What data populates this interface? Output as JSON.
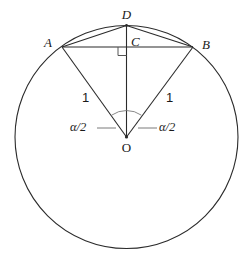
{
  "figure": {
    "background_color": "#ffffff",
    "stroke_color": "#2b2b2b",
    "width": 251,
    "height": 261
  },
  "labels": {
    "point_a": "A",
    "point_b": "B",
    "point_c": "C",
    "point_d": "D",
    "point_o": "O",
    "radius_left": "1",
    "radius_right": "1",
    "angle_left": "α/2",
    "angle_right": "α/2"
  },
  "geometry": {
    "circle": {
      "cx": 126.5,
      "cy": 137,
      "r": 111.5
    },
    "points": {
      "A": {
        "x": 62,
        "y": 47
      },
      "B": {
        "x": 193,
        "y": 47
      },
      "C": {
        "x": 126.5,
        "y": 47
      },
      "D": {
        "x": 126.5,
        "y": 25.5
      },
      "O": {
        "x": 126.5,
        "y": 137
      }
    },
    "segments": [
      {
        "name": "chord-ab",
        "from": "A",
        "to": "B"
      },
      {
        "name": "chord-ad",
        "from": "A",
        "to": "D"
      },
      {
        "name": "chord-db",
        "from": "D",
        "to": "B"
      },
      {
        "name": "radius-oa",
        "from": "O",
        "to": "A"
      },
      {
        "name": "radius-ob",
        "from": "O",
        "to": "B"
      },
      {
        "name": "segment-od",
        "from": "O",
        "to": "D"
      }
    ],
    "right_angle_marker": {
      "x": 118.5,
      "y": 47,
      "size": 8.5,
      "at": "C"
    },
    "angle_arc": {
      "center": "O",
      "radius": 26,
      "spans": "AOB"
    },
    "leader_lines": [
      {
        "name": "leader-left",
        "x1": 97,
        "x2": 116,
        "y": 128
      },
      {
        "name": "leader-right",
        "x1": 138,
        "x2": 157,
        "y": 128
      }
    ]
  },
  "label_positions": {
    "point_a": {
      "x": 48,
      "y": 38
    },
    "point_b": {
      "x": 202,
      "y": 38
    },
    "point_c": {
      "x": 131,
      "y": 35
    },
    "point_d": {
      "x": 126.5,
      "y": 8
    },
    "point_o": {
      "x": 126.5,
      "y": 141
    },
    "radius_left": {
      "x": 82,
      "y": 91
    },
    "radius_right": {
      "x": 166,
      "y": 91
    },
    "angle_left": {
      "x": 70,
      "y": 121
    },
    "angle_right": {
      "x": 159,
      "y": 121
    }
  }
}
